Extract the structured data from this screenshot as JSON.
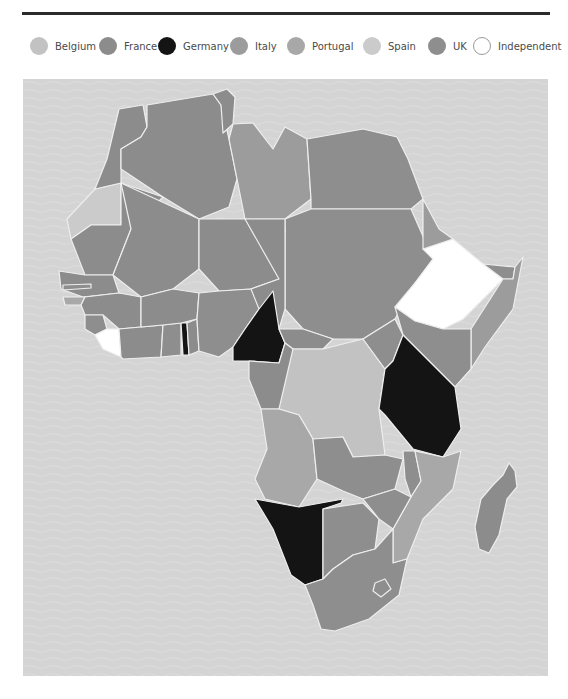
{
  "legend": {
    "items": [
      {
        "label": "Belgium",
        "color": "#c2c2c2",
        "x": 0
      },
      {
        "label": "France",
        "color": "#8c8c8c",
        "x": 69
      },
      {
        "label": "Germany",
        "color": "#141414",
        "x": 128
      },
      {
        "label": "Italy",
        "color": "#9c9c9c",
        "x": 200
      },
      {
        "label": "Portugal",
        "color": "#a8a8a8",
        "x": 257
      },
      {
        "label": "Spain",
        "color": "#cbcbcb",
        "x": 333
      },
      {
        "label": "UK",
        "color": "#8e8e8e",
        "x": 398
      },
      {
        "label": "Independent",
        "color": "#ffffff",
        "x": 443
      }
    ]
  },
  "map": {
    "title": "Colonial Africa",
    "ocean_color": "#d4d4d4",
    "border_color": "#eeeeee",
    "regions": [
      {
        "name": "Morocco",
        "ruler": "France"
      },
      {
        "name": "Algeria",
        "ruler": "France"
      },
      {
        "name": "Tunisia",
        "ruler": "France"
      },
      {
        "name": "Libya",
        "ruler": "Italy"
      },
      {
        "name": "Egypt",
        "ruler": "UK"
      },
      {
        "name": "Western Sahara",
        "ruler": "Spain"
      },
      {
        "name": "Mauritania",
        "ruler": "France"
      },
      {
        "name": "Mali",
        "ruler": "France"
      },
      {
        "name": "Niger",
        "ruler": "France"
      },
      {
        "name": "Chad",
        "ruler": "France"
      },
      {
        "name": "Sudan",
        "ruler": "UK"
      },
      {
        "name": "Eritrea",
        "ruler": "Italy"
      },
      {
        "name": "Ethiopia",
        "ruler": "Independent"
      },
      {
        "name": "Somalia",
        "ruler": "Italy"
      },
      {
        "name": "Senegal",
        "ruler": "France"
      },
      {
        "name": "Gambia",
        "ruler": "UK"
      },
      {
        "name": "Guinea-Bissau",
        "ruler": "Portugal"
      },
      {
        "name": "Guinea",
        "ruler": "France"
      },
      {
        "name": "Sierra Leone",
        "ruler": "UK"
      },
      {
        "name": "Liberia",
        "ruler": "Independent"
      },
      {
        "name": "Ivory Coast",
        "ruler": "France"
      },
      {
        "name": "Gold Coast",
        "ruler": "UK"
      },
      {
        "name": "Togo",
        "ruler": "Germany"
      },
      {
        "name": "Dahomey",
        "ruler": "France"
      },
      {
        "name": "Nigeria",
        "ruler": "UK"
      },
      {
        "name": "Cameroon",
        "ruler": "Germany"
      },
      {
        "name": "Central African Republic",
        "ruler": "France"
      },
      {
        "name": "Gabon",
        "ruler": "France"
      },
      {
        "name": "Congo",
        "ruler": "France"
      },
      {
        "name": "Belgian Congo",
        "ruler": "Belgium"
      },
      {
        "name": "Uganda",
        "ruler": "UK"
      },
      {
        "name": "Kenya",
        "ruler": "UK"
      },
      {
        "name": "Rwanda-Burundi",
        "ruler": "Germany"
      },
      {
        "name": "German East Africa",
        "ruler": "Germany"
      },
      {
        "name": "Angola",
        "ruler": "Portugal"
      },
      {
        "name": "Northern Rhodesia",
        "ruler": "UK"
      },
      {
        "name": "Nyasaland",
        "ruler": "UK"
      },
      {
        "name": "Mozambique",
        "ruler": "Portugal"
      },
      {
        "name": "German South West Africa",
        "ruler": "Germany"
      },
      {
        "name": "Bechuanaland",
        "ruler": "UK"
      },
      {
        "name": "Southern Rhodesia",
        "ruler": "UK"
      },
      {
        "name": "South Africa",
        "ruler": "UK"
      },
      {
        "name": "Madagascar",
        "ruler": "France"
      }
    ]
  }
}
